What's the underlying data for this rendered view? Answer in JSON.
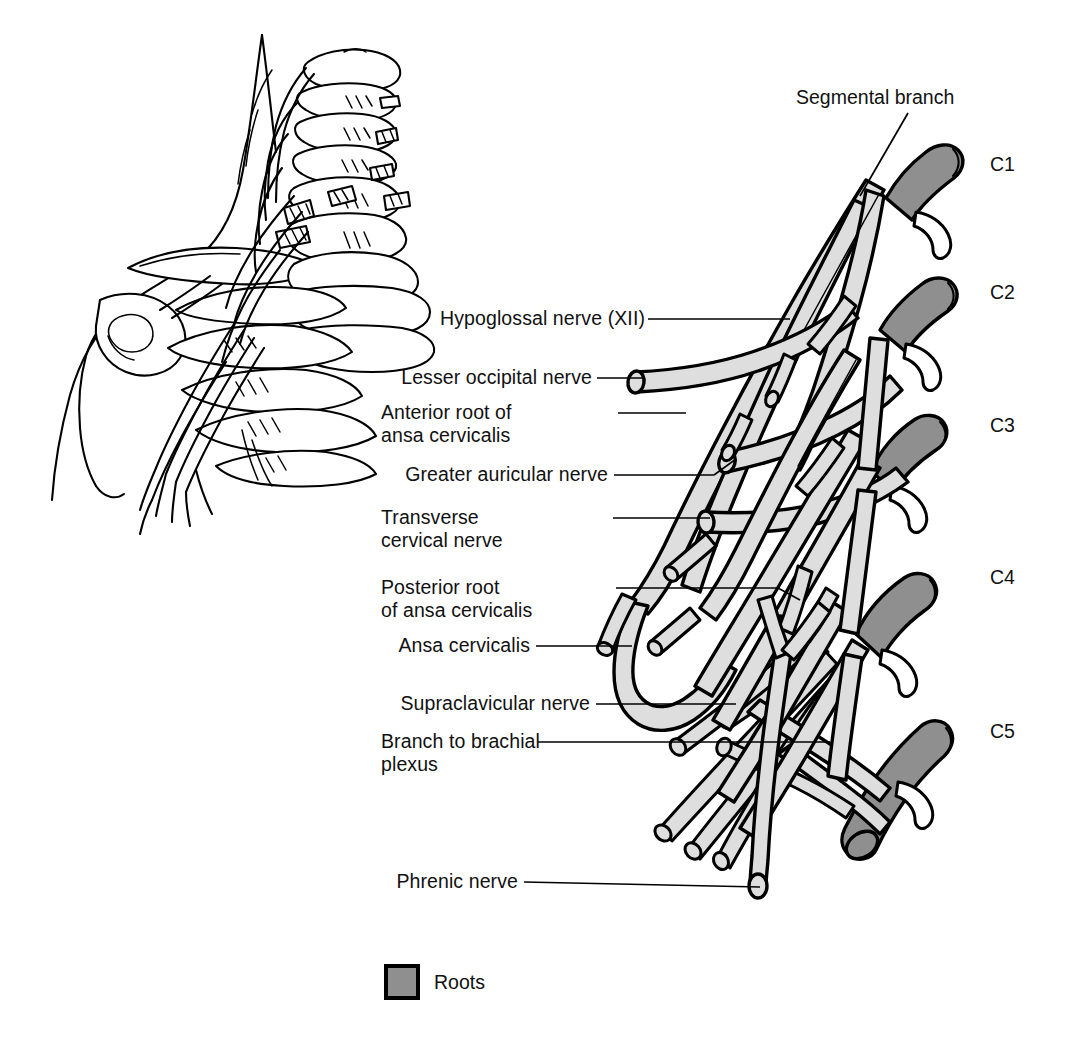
{
  "figure": {
    "colors": {
      "root_fill": "#8f8f8f",
      "branch_fill": "#dedede",
      "outline": "#000000",
      "background": "#ffffff",
      "text": "#111111"
    }
  },
  "labels": {
    "segmental_branch": "Segmental branch",
    "hypoglossal": "Hypoglossal nerve (XII)",
    "lesser_occipital": "Lesser occipital nerve",
    "anterior_root_line1": "Anterior root of",
    "anterior_root_line2": "ansa cervicalis",
    "greater_auricular": "Greater auricular nerve",
    "transverse_line1": "Transverse",
    "transverse_line2": "cervical nerve",
    "posterior_root_line1": "Posterior root",
    "posterior_root_line2": "of ansa cervicalis",
    "ansa_cervicalis": "Ansa cervicalis",
    "supraclavicular": "Supraclavicular nerve",
    "branch_brachial_line1": "Branch to brachial",
    "branch_brachial_line2": "plexus",
    "phrenic": "Phrenic nerve"
  },
  "spinal_levels": [
    {
      "id": "c1",
      "label": "C1"
    },
    {
      "id": "c2",
      "label": "C2"
    },
    {
      "id": "c3",
      "label": "C3"
    },
    {
      "id": "c4",
      "label": "C4"
    },
    {
      "id": "c5",
      "label": "C5"
    }
  ],
  "legend": {
    "swatch_color": "#8f8f8f",
    "label": "Roots"
  },
  "inset": {
    "description": "Orientation drawing of head, neck and shoulder showing cervical vertebrae, clavicle, scapula, ribs and the cervical and brachial plexus nerves"
  }
}
